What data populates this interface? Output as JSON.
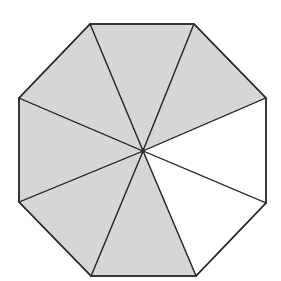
{
  "diagram": {
    "center": [
      143,
      151
    ],
    "vertices": [
      [
        90,
        24
      ],
      [
        194,
        24
      ],
      [
        266,
        98
      ],
      [
        266,
        203
      ],
      [
        196,
        276
      ],
      [
        91,
        276
      ],
      [
        19,
        202
      ],
      [
        19,
        98
      ]
    ],
    "total_sections": 8,
    "shaded_sections": 6,
    "unshaded_sections": 2,
    "shaded_indices": [
      0,
      1,
      5,
      6,
      7,
      8
    ],
    "colors": {
      "shade": "#d6d6d6",
      "stroke": "#2a2a2a",
      "background": "#ffffff"
    }
  }
}
